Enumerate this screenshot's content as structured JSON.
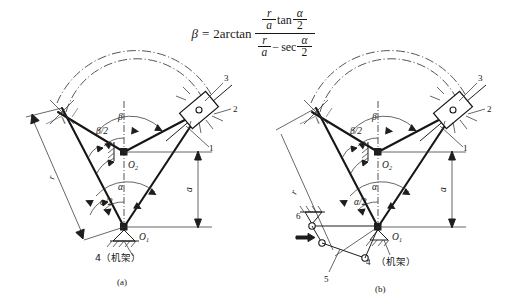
{
  "document": {
    "kind": "engineering-mechanism-diagram",
    "background_color": "#ffffff",
    "line_color": "#1d1d1d"
  },
  "formula": {
    "lhs": "β",
    "equals": "=",
    "coefficient": "2",
    "function": "arctan",
    "numerator": {
      "ratio_num": "r",
      "ratio_den": "a",
      "op": "tan",
      "angle_num": "α",
      "angle_den": "2"
    },
    "denominator": {
      "ratio_num": "r",
      "ratio_den": "a",
      "op": "sec",
      "minus": "−",
      "angle_num": "α",
      "angle_den": "2"
    }
  },
  "figures": [
    {
      "id": "fig-a",
      "caption": "(a)",
      "labels": {
        "beta": "β",
        "beta_half": "β/2",
        "alpha": "α",
        "alpha_half": "α/2",
        "pivot_upper": "O",
        "pivot_upper_sub": "2",
        "pivot_lower": "O",
        "pivot_lower_sub": "1",
        "dim_r": "r",
        "dim_a": "a",
        "link_l": "l"
      },
      "part_numbers": [
        {
          "id": "1",
          "label": "1"
        },
        {
          "id": "2",
          "label": "2"
        },
        {
          "id": "3",
          "label": "3"
        },
        {
          "id": "4",
          "label": "4（机架）"
        }
      ]
    },
    {
      "id": "fig-b",
      "caption": "(b)",
      "labels": {
        "beta": "β",
        "beta_half": "β/2",
        "alpha": "α",
        "alpha_half": "α/2",
        "pivot_upper": "O",
        "pivot_upper_sub": "2",
        "pivot_lower": "O",
        "pivot_lower_sub": "1",
        "dim_r": "r",
        "dim_a": "a",
        "link_l": "l"
      },
      "part_numbers": [
        {
          "id": "1",
          "label": "1"
        },
        {
          "id": "2",
          "label": "2"
        },
        {
          "id": "3",
          "label": "3"
        },
        {
          "id": "4",
          "label": "4"
        },
        {
          "id": "4cn",
          "label": "（机架）"
        },
        {
          "id": "5",
          "label": "5"
        },
        {
          "id": "6",
          "label": "6"
        }
      ]
    }
  ]
}
